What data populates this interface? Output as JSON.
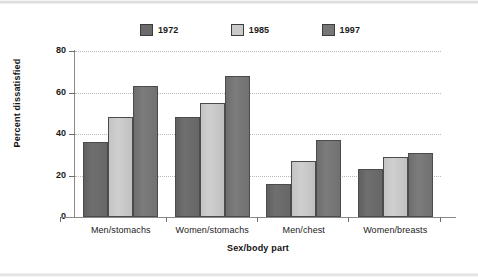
{
  "chart_data": {
    "type": "bar",
    "title": "",
    "xlabel": "Sex/body part",
    "ylabel": "Percent dissatisfied",
    "categories": [
      "Men/stomachs",
      "Women/stomachs",
      "Men/chest",
      "Women/breasts"
    ],
    "series": [
      {
        "name": "1972",
        "color": "#6b6b6b",
        "values": [
          36,
          48,
          16,
          23
        ]
      },
      {
        "name": "1985",
        "color": "#c9c9c9",
        "values": [
          48,
          55,
          27,
          29
        ]
      },
      {
        "name": "1997",
        "color": "#777777",
        "values": [
          63,
          68,
          37,
          31
        ]
      }
    ],
    "ylim": [
      0,
      80
    ],
    "yticks": [
      0,
      20,
      40,
      60,
      80
    ],
    "ytick_labels": [
      "0",
      "20",
      "40",
      "60",
      "80"
    ],
    "grid": true,
    "grid_axis": "y",
    "legend_position": "top"
  },
  "axes": {
    "y_title": "Percent dissatisfied",
    "x_title": "Sex/body part"
  }
}
